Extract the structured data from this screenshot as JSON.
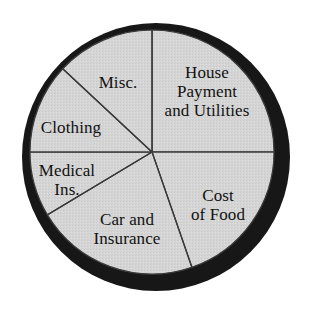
{
  "chart_data": {
    "type": "pie",
    "title": "",
    "subtitle": "",
    "xlabel": "",
    "ylabel": "",
    "legend_position": "none",
    "grid": false,
    "categories": [
      "House Payment and Utilities",
      "Cost of Food",
      "Car and Insurance",
      "Medical Ins.",
      "Clothing",
      "Misc."
    ],
    "values": [
      25.0,
      19.7,
      21.7,
      8.1,
      12.0,
      13.5
    ],
    "units": "percent of budget",
    "start_angle_deg": 90,
    "direction": "clockwise",
    "slices": [
      {
        "name": "House Payment and Utilities",
        "label_lines": [
          "House",
          "Payment",
          "and Utilities"
        ],
        "value": 25.0,
        "angle_deg": 90,
        "start_deg": 90,
        "end_deg": 0,
        "fill": "#d4d4d4"
      },
      {
        "name": "Cost of Food",
        "label_lines": [
          "Cost",
          "of Food"
        ],
        "value": 19.7,
        "angle_deg": 71,
        "start_deg": 0,
        "end_deg": -71,
        "fill": "#d4d4d4"
      },
      {
        "name": "Car and Insurance",
        "label_lines": [
          "Car and",
          "Insurance"
        ],
        "value": 21.7,
        "angle_deg": 78,
        "start_deg": -71,
        "end_deg": -149,
        "fill": "#d4d4d4"
      },
      {
        "name": "Medical Ins.",
        "label_lines": [
          "Medical",
          "Ins."
        ],
        "value": 8.1,
        "angle_deg": 29,
        "start_deg": -149,
        "end_deg": -180,
        "fill": "#d4d4d4"
      },
      {
        "name": "Clothing",
        "label_lines": [
          "Clothing"
        ],
        "value": 12.0,
        "angle_deg": 43,
        "start_deg": 180,
        "end_deg": 137,
        "fill": "#d4d4d4"
      },
      {
        "name": "Misc.",
        "label_lines": [
          "Misc."
        ],
        "value": 13.5,
        "angle_deg": 47,
        "start_deg": 137,
        "end_deg": 90,
        "fill": "#d4d4d4"
      }
    ],
    "style": {
      "background": "#ffffff",
      "slice_fill": "#d4d4d4",
      "slice_outline": "#3a3a3a",
      "shadow_color": "#1a1a1a",
      "label_color": "#111111"
    },
    "geometry": {
      "center_x": 152,
      "center_y": 152,
      "radius": 122
    }
  },
  "labels": {
    "house": {
      "l1": "House",
      "l2": "Payment",
      "l3": "and Utilities"
    },
    "food": {
      "l1": "Cost",
      "l2": "of Food"
    },
    "car": {
      "l1": "Car and",
      "l2": "Insurance"
    },
    "medical": {
      "l1": "Medical",
      "l2": "Ins."
    },
    "clothing": {
      "l1": "Clothing"
    },
    "misc": {
      "l1": "Misc."
    }
  }
}
